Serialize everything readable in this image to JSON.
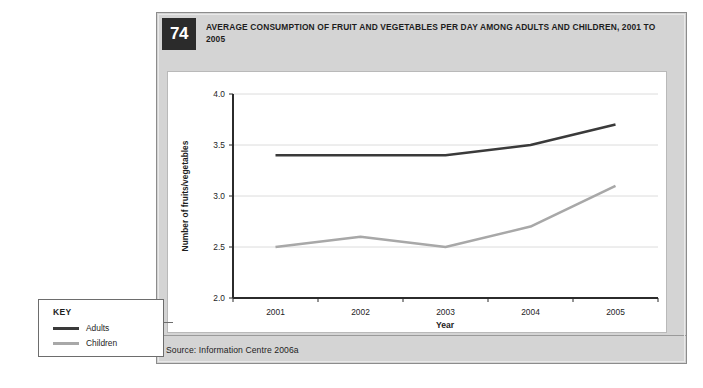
{
  "figure": {
    "number": "74",
    "title": "AVERAGE CONSUMPTION OF FRUIT AND VEGETABLES PER DAY AMONG ADULTS AND CHILDREN, 2001 TO 2005",
    "source": "Source: Information Centre 2006a"
  },
  "key": {
    "title": "KEY",
    "entries": [
      {
        "label": "Adults",
        "color": "#3a3a3a"
      },
      {
        "label": "Children",
        "color": "#a8a8a8"
      }
    ]
  },
  "chart_data": {
    "type": "line",
    "title": "AVERAGE CONSUMPTION OF FRUIT AND VEGETABLES PER DAY AMONG ADULTS AND CHILDREN, 2001 TO 2005",
    "xlabel": "Year",
    "ylabel": "Number of fruits/vegetables",
    "categories": [
      "2001",
      "2002",
      "2003",
      "2004",
      "2005"
    ],
    "series": [
      {
        "name": "Adults",
        "color": "#3a3a3a",
        "values": [
          3.4,
          3.4,
          3.4,
          3.5,
          3.7
        ]
      },
      {
        "name": "Children",
        "color": "#a8a8a8",
        "values": [
          2.5,
          2.6,
          2.5,
          2.7,
          3.1
        ]
      }
    ],
    "ylim": [
      2.0,
      4.0
    ],
    "yticks": [
      "2.0",
      "2.5",
      "3.0",
      "3.5",
      "4.0"
    ],
    "ytick_values": [
      2.0,
      2.5,
      3.0,
      3.5,
      4.0
    ],
    "xticks": [
      "2001",
      "2002",
      "2003",
      "2004",
      "2005"
    ],
    "grid": true,
    "legend_position": "external-left-bottom"
  }
}
